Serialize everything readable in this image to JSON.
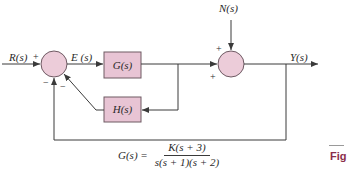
{
  "diagram": {
    "type": "feedback-control-block-diagram",
    "signals": {
      "input": "R(s)",
      "error": "E (s)",
      "disturbance": "N(s)",
      "output": "Y(s)"
    },
    "blocks": {
      "forward": "G(s)",
      "inner_feedback": "H(s)"
    },
    "summing_junction_1": {
      "signs": {
        "input": "+",
        "outer_feedback": "−",
        "inner_feedback": "−"
      }
    },
    "summing_junction_2": {
      "signs": {
        "disturbance": "+",
        "forward": "+"
      }
    },
    "transfer_function": {
      "lhs": "G(s) =",
      "numerator": "K(s + 3)",
      "denominator": "s(s + 1)(s + 2)"
    },
    "caption": {
      "label": "Fig"
    },
    "colors": {
      "block_fill": "#e8c4d4",
      "block_stroke": "#6e5a63",
      "junction_fill": "#ecccd9",
      "line": "#3a3a3a",
      "caption": "#8b2e4a"
    }
  }
}
